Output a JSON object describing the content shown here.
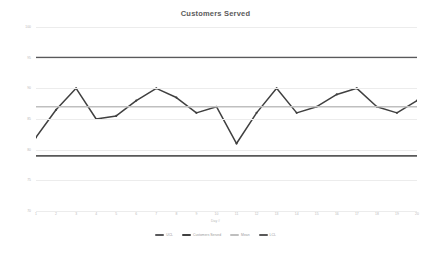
{
  "chart_data": {
    "type": "line",
    "title": "Customers Served",
    "xlabel": "Day #",
    "ylabel": "Number of Customers",
    "x": [
      1,
      2,
      3,
      4,
      5,
      6,
      7,
      8,
      9,
      10,
      11,
      12,
      13,
      14,
      15,
      16,
      17,
      18,
      19,
      20
    ],
    "xtick_labels": [
      "1",
      "2",
      "3",
      "4",
      "5",
      "6",
      "7",
      "8",
      "9",
      "10",
      "11",
      "12",
      "13",
      "14",
      "15",
      "16",
      "17",
      "18",
      "19",
      "20"
    ],
    "ytick_labels": [
      "100",
      "95",
      "90",
      "85",
      "80",
      "75",
      "70"
    ],
    "ytick_values": [
      100,
      95,
      90,
      85,
      80,
      75,
      70
    ],
    "ylim": [
      70,
      100
    ],
    "xlim": [
      1,
      20
    ],
    "grid": true,
    "legend_position": "bottom",
    "series": [
      {
        "name": "UCL",
        "type": "line",
        "color": "#59595b",
        "constant_value": 95,
        "values": [
          95,
          95,
          95,
          95,
          95,
          95,
          95,
          95,
          95,
          95,
          95,
          95,
          95,
          95,
          95,
          95,
          95,
          95,
          95,
          95
        ]
      },
      {
        "name": "Customers Served",
        "type": "line",
        "color": "#404040",
        "markers": true,
        "values": [
          82.0,
          86.5,
          90.0,
          85.0,
          85.5,
          88.0,
          90.0,
          88.5,
          86.0,
          87.0,
          81.0,
          86.0,
          90.0,
          86.0,
          87.0,
          89.0,
          90.0,
          87.0,
          86.0,
          88.0
        ]
      },
      {
        "name": "Mean",
        "type": "line",
        "color": "#bfbfbf",
        "constant_value": 87,
        "values": [
          87,
          87,
          87,
          87,
          87,
          87,
          87,
          87,
          87,
          87,
          87,
          87,
          87,
          87,
          87,
          87,
          87,
          87,
          87,
          87
        ]
      },
      {
        "name": "LCL",
        "type": "line",
        "color": "#595959",
        "constant_value": 79,
        "values": [
          79,
          79,
          79,
          79,
          79,
          79,
          79,
          79,
          79,
          79,
          79,
          79,
          79,
          79,
          79,
          79,
          79,
          79,
          79,
          79
        ]
      }
    ],
    "colors": {
      "ucl": "#59595b",
      "data": "#404040",
      "mean": "#bfbfbf",
      "lcl": "#595959",
      "grid": "#ececec",
      "tick_text": "#b9b9b9",
      "title_text": "#5a5a5a"
    }
  }
}
